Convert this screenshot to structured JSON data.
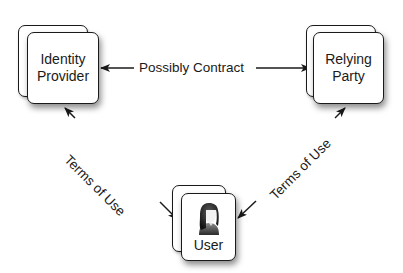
{
  "diagram": {
    "nodes": [
      {
        "id": "identity_provider",
        "label_line1": "Identity",
        "label_line2": "Provider"
      },
      {
        "id": "relying_party",
        "label_line1": "Relying",
        "label_line2": "Party"
      },
      {
        "id": "user",
        "label": "User",
        "icon": "person-avatar-icon"
      }
    ],
    "edges": [
      {
        "from": "identity_provider",
        "to": "relying_party",
        "label": "Possibly Contract",
        "direction": "bidirectional"
      },
      {
        "from": "user",
        "to": "identity_provider",
        "label": "Terms of Use",
        "direction": "bidirectional"
      },
      {
        "from": "user",
        "to": "relying_party",
        "label": "Terms of Use",
        "direction": "bidirectional"
      }
    ],
    "colors": {
      "stroke": "#1a1a1a",
      "card_fill": "#ffffff",
      "background": "#ffffff"
    }
  }
}
